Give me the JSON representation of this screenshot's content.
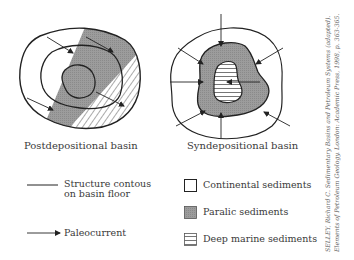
{
  "diagrams": {
    "left": {
      "caption": "Postdepositional basin"
    },
    "right": {
      "caption": "Syndepositional basin"
    }
  },
  "legend": {
    "lines": [
      {
        "symbol": "line",
        "label_line1": "Structure contous",
        "label_line2": "on basin floor"
      },
      {
        "symbol": "arrow",
        "label": "Paleocurrent"
      }
    ],
    "sediments": [
      {
        "symbol": "empty-box",
        "label": "Continental sediments"
      },
      {
        "symbol": "gray-box",
        "label": "Paralic sediments",
        "color": "#9a9a9a"
      },
      {
        "symbol": "striped-box",
        "label": "Deep marine sediments"
      }
    ]
  },
  "citation": {
    "line1": "SELLEY, Richard C. Sedimentary Basins and Petroleum Systems (adapted).",
    "line2": "Elements of Petroleum Geology. London: Academic Press, 1998, p. 363-365."
  }
}
